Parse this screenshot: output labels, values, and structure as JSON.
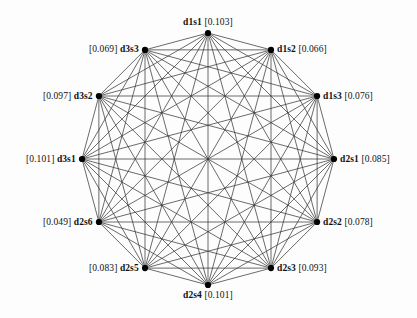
{
  "figure": {
    "type": "network-graph",
    "background_color": "#fdfdfd",
    "edge_color": "#3a3a3a",
    "node_color": "#000000",
    "label_color": "#111111"
  },
  "chart_data": {
    "type": "diagram",
    "subtype": "complete-graph",
    "title": "",
    "xlabel": "",
    "ylabel": "",
    "layout": "circular",
    "center": [
      208,
      159
    ],
    "radius": 126,
    "node_count": 12,
    "edge_style": "all-pairs",
    "value_bracket_open": "[",
    "value_bracket_close": "]",
    "nodes": [
      {
        "id": "d1s1",
        "value": "0.103",
        "angle_deg": -90,
        "label_side": "top",
        "label_text": "d1s1 [0.103]"
      },
      {
        "id": "d1s2",
        "value": "0.066",
        "angle_deg": -60,
        "label_side": "right",
        "label_text": "d1s2 [0.066]"
      },
      {
        "id": "d1s3",
        "value": "0.076",
        "angle_deg": -30,
        "label_side": "right",
        "label_text": "d1s3 [0.076]"
      },
      {
        "id": "d2s1",
        "value": "0.085",
        "angle_deg": 0,
        "label_side": "right",
        "label_text": "d2s1 [0.085]"
      },
      {
        "id": "d2s2",
        "value": "0.078",
        "angle_deg": 30,
        "label_side": "right",
        "label_text": "d2s2 [0.078]"
      },
      {
        "id": "d2s3",
        "value": "0.093",
        "angle_deg": 60,
        "label_side": "right",
        "label_text": "d2s3 [0.093]"
      },
      {
        "id": "d2s4",
        "value": "0.101",
        "angle_deg": 90,
        "label_side": "bottom",
        "label_text": "d2s4 [0.101]"
      },
      {
        "id": "d2s5",
        "value": "0.083",
        "angle_deg": 120,
        "label_side": "left",
        "label_text": "[0.083] d2s5"
      },
      {
        "id": "d2s6",
        "value": "0.049",
        "angle_deg": 150,
        "label_side": "left",
        "label_text": "[0.049] d2s6"
      },
      {
        "id": "d3s1",
        "value": "0.101",
        "angle_deg": 180,
        "label_side": "left",
        "label_text": "[0.101] d3s1"
      },
      {
        "id": "d3s2",
        "value": "0.097",
        "angle_deg": 210,
        "label_side": "left",
        "label_text": "[0.097] d3s2"
      },
      {
        "id": "d3s3",
        "value": "0.069",
        "angle_deg": 240,
        "label_side": "left",
        "label_text": "[0.069] d3s3"
      }
    ]
  }
}
